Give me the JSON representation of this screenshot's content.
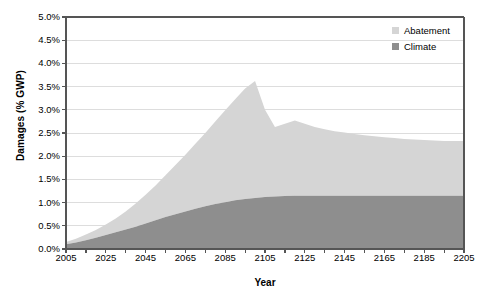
{
  "chart_data": {
    "type": "area",
    "stacked": true,
    "title": "",
    "xlabel": "Year",
    "ylabel": "Damages (% GWP)",
    "xlim": [
      2005,
      2205
    ],
    "ylim": [
      0.0,
      5.0
    ],
    "grid": true,
    "legend_position": "top-right",
    "x_tick_labels": [
      "2005",
      "2025",
      "2045",
      "2065",
      "2085",
      "2105",
      "2125",
      "2145",
      "2165",
      "2185",
      "2205"
    ],
    "y_tick_labels": [
      "0.0%",
      "0.5%",
      "1.0%",
      "1.5%",
      "2.0%",
      "2.5%",
      "3.0%",
      "3.5%",
      "4.0%",
      "4.5%",
      "5.0%"
    ],
    "x_minor_tick_interval": 10,
    "colors": {
      "abatement": "#d5d5d5",
      "climate": "#8e8e8e",
      "grid": "#dddddd",
      "axis": "#555555"
    },
    "x": [
      2005,
      2010,
      2015,
      2020,
      2025,
      2030,
      2035,
      2040,
      2045,
      2050,
      2055,
      2060,
      2065,
      2070,
      2075,
      2080,
      2085,
      2090,
      2095,
      2100,
      2105,
      2110,
      2115,
      2120,
      2125,
      2130,
      2135,
      2140,
      2145,
      2150,
      2155,
      2160,
      2165,
      2170,
      2175,
      2180,
      2185,
      2190,
      2195,
      2200,
      2205
    ],
    "series": [
      {
        "name": "Climate",
        "values": [
          0.1,
          0.14,
          0.19,
          0.24,
          0.3,
          0.36,
          0.42,
          0.48,
          0.55,
          0.62,
          0.69,
          0.75,
          0.81,
          0.87,
          0.92,
          0.97,
          1.01,
          1.05,
          1.08,
          1.1,
          1.12,
          1.13,
          1.14,
          1.15,
          1.15,
          1.15,
          1.15,
          1.15,
          1.15,
          1.15,
          1.15,
          1.15,
          1.15,
          1.15,
          1.15,
          1.15,
          1.15,
          1.15,
          1.15,
          1.15,
          1.15
        ]
      },
      {
        "name": "Abatement",
        "values": [
          0.05,
          0.08,
          0.12,
          0.17,
          0.23,
          0.3,
          0.39,
          0.5,
          0.62,
          0.75,
          0.9,
          1.06,
          1.22,
          1.4,
          1.58,
          1.78,
          1.98,
          2.18,
          2.38,
          2.52,
          1.88,
          1.5,
          1.56,
          1.62,
          1.55,
          1.48,
          1.43,
          1.39,
          1.36,
          1.33,
          1.3,
          1.28,
          1.26,
          1.24,
          1.22,
          1.21,
          1.2,
          1.19,
          1.18,
          1.18,
          1.18
        ]
      }
    ],
    "totals": [
      0.15,
      0.22,
      0.31,
      0.41,
      0.53,
      0.66,
      0.81,
      0.98,
      1.17,
      1.37,
      1.59,
      1.81,
      2.03,
      2.27,
      2.5,
      2.75,
      2.99,
      3.23,
      3.46,
      3.62,
      3.0,
      2.63,
      2.7,
      2.77,
      2.7,
      2.63,
      2.58,
      2.54,
      2.51,
      2.48,
      2.45,
      2.43,
      2.41,
      2.39,
      2.37,
      2.36,
      2.35,
      2.34,
      2.33,
      2.33,
      2.33
    ]
  },
  "legend": {
    "items": [
      {
        "label": "Abatement",
        "color": "#d5d5d5"
      },
      {
        "label": "Climate",
        "color": "#8e8e8e"
      }
    ]
  }
}
